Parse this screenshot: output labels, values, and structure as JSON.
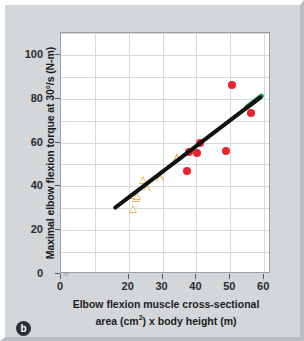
{
  "panel": {
    "label": "b"
  },
  "chart_data": {
    "type": "scatter",
    "title": "",
    "xlabel_line1": "Elbow flexion muscle cross-sectional",
    "xlabel_line2_pre": "area (cm",
    "xlabel_line2_sup": "2",
    "xlabel_line2_post": ") x body height (m)",
    "ylabel": "Maximal elbow flexion torque at 30°/s (N-m)",
    "xlim": [
      0,
      62
    ],
    "ylim": [
      0,
      110
    ],
    "xticks": [
      0,
      20,
      30,
      40,
      50,
      60
    ],
    "xtick_labels": [
      "0",
      "20",
      "30",
      "40",
      "50",
      "60"
    ],
    "yticks": [
      0,
      20,
      40,
      60,
      80,
      100
    ],
    "ytick_labels": [
      "0",
      "20",
      "40",
      "60",
      "80",
      "100"
    ],
    "grid": true,
    "axis_break": {
      "present": true,
      "between": [
        0,
        20
      ],
      "glyph": "≈"
    },
    "legend": {
      "position": "none",
      "entries": []
    },
    "series": [
      {
        "name": "open-triangles",
        "marker": "triangle-open",
        "color": "#e8b34a",
        "points": [
          {
            "x": 21.3,
            "y": 29.8
          },
          {
            "x": 21.7,
            "y": 36.2
          },
          {
            "x": 22.3,
            "y": 34.8
          },
          {
            "x": 22.6,
            "y": 35.6
          },
          {
            "x": 24.3,
            "y": 42.9
          },
          {
            "x": 25.6,
            "y": 39.6
          },
          {
            "x": 29.4,
            "y": 44.2
          },
          {
            "x": 34.3,
            "y": 53.3
          }
        ]
      },
      {
        "name": "filled-circles",
        "marker": "circle-filled",
        "color": "#e8252b",
        "points": [
          {
            "x": 37.1,
            "y": 47.2
          },
          {
            "x": 37.7,
            "y": 55.6
          },
          {
            "x": 40.2,
            "y": 55.4
          },
          {
            "x": 40.9,
            "y": 59.6
          },
          {
            "x": 48.6,
            "y": 56.2
          },
          {
            "x": 50.4,
            "y": 86.4
          },
          {
            "x": 56.2,
            "y": 73.7
          }
        ]
      }
    ],
    "trendline": {
      "name": "regression-line",
      "color": "#111111",
      "tip_color": "#1f9e4a",
      "x0": 16.0,
      "y0": 30.3,
      "x1": 59.2,
      "y1": 81.2,
      "width_px": 4
    }
  }
}
